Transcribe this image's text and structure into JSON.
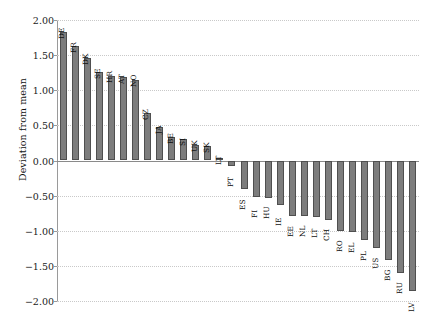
{
  "chart_data": {
    "type": "bar",
    "title": "",
    "xlabel": "",
    "ylabel": "Deviation from mean",
    "ylim": [
      -2.0,
      2.0
    ],
    "yticks": [
      2.0,
      1.5,
      1.0,
      0.5,
      0.0,
      -0.5,
      -1.0,
      -1.5,
      -2.0
    ],
    "ytick_labels": [
      "2.00",
      "1.50",
      "1.00",
      "0.50",
      "0.00",
      "-0.50",
      "-1.00",
      "-1.50",
      "-2.00"
    ],
    "grid": true,
    "legend": null,
    "categories": [
      "DE",
      "FR",
      "DK",
      "SE",
      "HR",
      "AT",
      "NO",
      "CZ",
      "JA",
      "BE",
      "SI",
      "UK",
      "SK",
      "LT",
      "PT",
      "ES",
      "FI",
      "HU",
      "IE",
      "EE",
      "NL",
      "LT",
      "CH",
      "RO",
      "EL",
      "PL",
      "US",
      "BG",
      "RU",
      "LV"
    ],
    "values": [
      1.83,
      1.63,
      1.46,
      1.26,
      1.2,
      1.19,
      1.15,
      0.68,
      0.47,
      0.33,
      0.3,
      0.22,
      0.21,
      0.03,
      -0.08,
      -0.4,
      -0.52,
      -0.53,
      -0.63,
      -0.79,
      -0.79,
      -0.8,
      -0.85,
      -1.0,
      -1.02,
      -1.13,
      -1.24,
      -1.41,
      -1.6,
      -1.86
    ]
  }
}
